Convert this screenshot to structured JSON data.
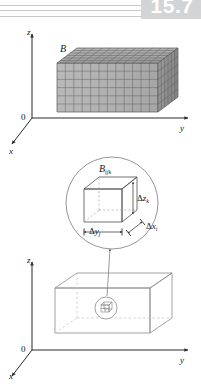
{
  "page": {
    "section_number": "15.7",
    "background": "#ffffff",
    "ink": "#161616"
  },
  "figures": [
    {
      "id": "figure-partitioned-box",
      "caption_label": "B",
      "axes": {
        "z": "z",
        "y": "y",
        "x": "x",
        "origin": "0"
      },
      "grid": {
        "columns": 12,
        "rows": 5,
        "depth": 6
      },
      "colors": {
        "top_face": "#a8a8a8",
        "front_face": "#b4b4b4",
        "side_face": "#8f8f8f",
        "grid_line": "#4a4a4a"
      }
    },
    {
      "id": "figure-magnified-subbox",
      "caption_label": "B",
      "caption_sub": "ijk",
      "dimension_labels": [
        {
          "name": "delta-z",
          "delta": "Δ",
          "var": "z",
          "sub": "k"
        },
        {
          "name": "delta-y",
          "delta": "Δ",
          "var": "y",
          "sub": "j"
        },
        {
          "name": "delta-x",
          "delta": "Δ",
          "var": "x",
          "sub": "i"
        }
      ],
      "colors": {
        "circle_stroke": "#7b7b7b",
        "cube_stroke": "#5d5d5d",
        "hidden_edge": "#a0a0a0"
      }
    },
    {
      "id": "figure-wireframe-box",
      "axes": {
        "z": "z",
        "y": "y",
        "x": "x",
        "origin": "0"
      },
      "callout": {
        "name": "subbox-callout-circle"
      },
      "colors": {
        "wire": "#8c8c8c",
        "hidden_edge": "#bdbdbd",
        "axis": "#2b2b2b"
      }
    }
  ]
}
